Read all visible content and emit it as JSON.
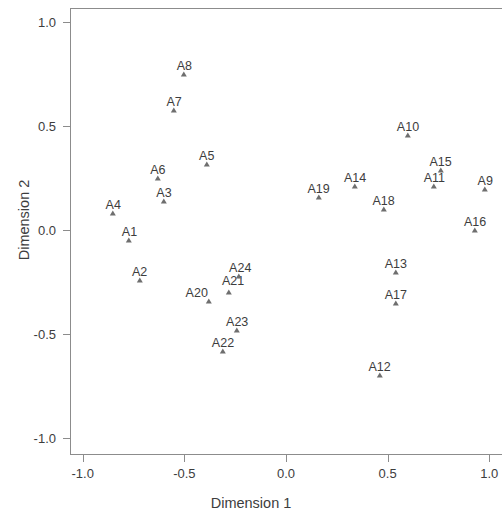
{
  "chart_data": {
    "type": "scatter",
    "title": "",
    "xlabel": "Dimension 1",
    "ylabel": "Dimension 2",
    "xlim": [
      -1.06,
      1.06
    ],
    "ylim": [
      -1.07,
      1.09
    ],
    "xticks": [
      -1.0,
      -0.5,
      0.0,
      0.5,
      1.0
    ],
    "xtick_labels": [
      "-1.0",
      "-0.5",
      "0.0",
      "0.5",
      "1.0"
    ],
    "yticks": [
      1.0,
      0.5,
      0.0,
      -0.5,
      -1.0
    ],
    "ytick_labels": [
      "1.0",
      "0.5",
      "0.0",
      "-0.5",
      "-1.0"
    ],
    "grid": false,
    "legend": false,
    "marker": "triangle",
    "marker_color": "#6e6e6e",
    "label_position": "above",
    "points": [
      {
        "label": "A1",
        "x": -0.77,
        "y": -0.06
      },
      {
        "label": "A2",
        "x": -0.72,
        "y": -0.25
      },
      {
        "label": "A3",
        "x": -0.6,
        "y": 0.13
      },
      {
        "label": "A4",
        "x": -0.85,
        "y": 0.07
      },
      {
        "label": "A5",
        "x": -0.39,
        "y": 0.31
      },
      {
        "label": "A6",
        "x": -0.63,
        "y": 0.24
      },
      {
        "label": "A7",
        "x": -0.55,
        "y": 0.57
      },
      {
        "label": "A8",
        "x": -0.5,
        "y": 0.74
      },
      {
        "label": "A9",
        "x": 0.98,
        "y": 0.19
      },
      {
        "label": "A10",
        "x": 0.6,
        "y": 0.45
      },
      {
        "label": "A11",
        "x": 0.73,
        "y": 0.2
      },
      {
        "label": "A12",
        "x": 0.46,
        "y": -0.71
      },
      {
        "label": "A13",
        "x": 0.54,
        "y": -0.21
      },
      {
        "label": "A14",
        "x": 0.34,
        "y": 0.2
      },
      {
        "label": "A15",
        "x": 0.76,
        "y": 0.28
      },
      {
        "label": "A16",
        "x": 0.93,
        "y": -0.01
      },
      {
        "label": "A17",
        "x": 0.54,
        "y": -0.36
      },
      {
        "label": "A18",
        "x": 0.48,
        "y": 0.09
      },
      {
        "label": "A19",
        "x": 0.16,
        "y": 0.15
      },
      {
        "label": "A20",
        "x": -0.38,
        "y": -0.35
      },
      {
        "label": "A21",
        "x": -0.28,
        "y": -0.31
      },
      {
        "label": "A22",
        "x": -0.31,
        "y": -0.59
      },
      {
        "label": "A23",
        "x": -0.24,
        "y": -0.49
      },
      {
        "label": "A24",
        "x": -0.23,
        "y": -0.23
      }
    ]
  },
  "label_offsets": {
    "A20": {
      "dx": -12,
      "dy": 0
    },
    "A21": {
      "dx": 4,
      "dy": -3
    },
    "A24": {
      "dx": 1,
      "dy": 0
    }
  }
}
